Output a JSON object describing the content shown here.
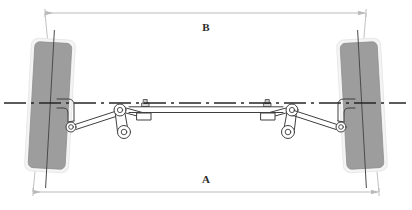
{
  "figure": {
    "kind": "engineering-diagram",
    "background_color": "#ffffff",
    "line_color": "#3a3a3a",
    "dimension_line_color": "#b9b9b9",
    "tire_fill_color": "#9d9d9d",
    "tire_edge_color": "#f2f2f2",
    "centerline_color": "#262626"
  },
  "dimensions": [
    {
      "id": "B",
      "label": "B",
      "position": "top",
      "description": "distance between rear edges of the tires",
      "line_y": 13,
      "label_x": 206,
      "label_y": 27,
      "x_start": 45,
      "x_end": 366
    },
    {
      "id": "A",
      "label": "A",
      "position": "bottom",
      "description": "distance between front edges of the tires",
      "line_y": 192,
      "label_x": 206,
      "label_y": 180,
      "x_start": 33,
      "x_end": 379
    }
  ],
  "axis": {
    "name": "axle-centerline",
    "style": "dash-dot",
    "y": 103,
    "x_start": 4,
    "x_end": 406
  },
  "wheels": [
    {
      "id": "left-wheel",
      "name": "left-tire",
      "center_x": 50,
      "center_y": 105,
      "width": 40,
      "height": 131,
      "tilt_deg": 3.2
    },
    {
      "id": "right-wheel",
      "name": "right-tire",
      "center_x": 362,
      "center_y": 105,
      "width": 40,
      "height": 131,
      "tilt_deg": -3.2
    }
  ],
  "linkage": {
    "name": "steering-linkage",
    "parts": [
      {
        "id": "left-knuckle-arm",
        "label": "left steering knuckle arm"
      },
      {
        "id": "left-idler-arm",
        "label": "left idler arm"
      },
      {
        "id": "left-tie-rod",
        "label": "left tie rod"
      },
      {
        "id": "center-drag-link",
        "label": "center drag link"
      },
      {
        "id": "left-clamp",
        "label": "left tie rod clamp"
      },
      {
        "id": "right-clamp",
        "label": "right tie rod clamp"
      },
      {
        "id": "right-tie-rod",
        "label": "right tie rod"
      },
      {
        "id": "right-idler-arm",
        "label": "right idler arm"
      },
      {
        "id": "right-knuckle-arm",
        "label": "right steering knuckle arm"
      }
    ]
  }
}
